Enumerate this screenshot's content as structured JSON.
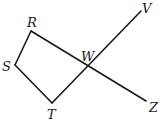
{
  "diagram": {
    "points": {
      "R": {
        "label": "R",
        "x": 31,
        "y": 31,
        "lx": 27,
        "ly": 27
      },
      "S": {
        "label": "S",
        "x": 15,
        "y": 65,
        "lx": 2,
        "ly": 71
      },
      "T": {
        "label": "T",
        "x": 52,
        "y": 103,
        "lx": 47,
        "ly": 119
      },
      "W": {
        "label": "W",
        "x": 88,
        "y": 67,
        "lx": 81,
        "ly": 61
      },
      "V": {
        "label": "V",
        "x": 141,
        "y": 11,
        "lx": 142,
        "ly": 13
      },
      "Z": {
        "label": "Z",
        "x": 146,
        "y": 101,
        "lx": 149,
        "ly": 112
      }
    },
    "segments": [
      {
        "name": "segment-RS",
        "from": "R",
        "to": "S"
      },
      {
        "name": "segment-ST",
        "from": "S",
        "to": "T"
      },
      {
        "name": "line-TV",
        "from": "T",
        "to": "V"
      },
      {
        "name": "line-RZ",
        "from": "R",
        "to": "Z"
      }
    ],
    "color": "#1a1a1a"
  }
}
